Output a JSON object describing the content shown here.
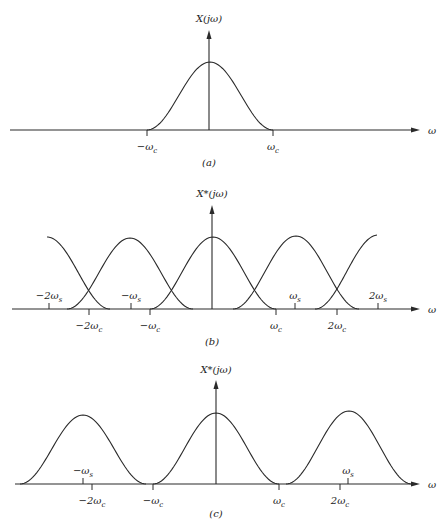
{
  "figure": {
    "panels": [
      {
        "id": "a",
        "caption": "(a)",
        "y_label": "X(jω)",
        "x_label": "ω",
        "axis_y": 130,
        "axis_x_start": 10,
        "axis_x_end": 420,
        "origin_x": 209,
        "arrow_top": 30,
        "caption_pos": [
          209,
          166
        ],
        "ylabel_pos": [
          209,
          22
        ],
        "xlabel_pos": [
          428,
          134
        ],
        "curves": [
          {
            "x0": 147,
            "x1": 273,
            "peak_y": 62
          }
        ],
        "ticks_below": [
          {
            "x": 147,
            "label": "−ω",
            "sub": "c"
          },
          {
            "x": 273,
            "label": "ω",
            "sub": "c"
          }
        ],
        "ticks_above": []
      },
      {
        "id": "b",
        "caption": "(b)",
        "y_label": "X*(jω)",
        "x_label": "ω",
        "axis_y": 309,
        "axis_x_start": 12,
        "axis_x_end": 420,
        "origin_x": 212,
        "arrow_top": 205,
        "caption_pos": [
          212,
          345
        ],
        "ylabel_pos": [
          212,
          197
        ],
        "xlabel_pos": [
          428,
          313
        ],
        "curves": [
          {
            "x0": -16,
            "x1": 110,
            "peak_y": 237,
            "clip": [
              47,
              110
            ]
          },
          {
            "x0": 67,
            "x1": 193,
            "peak_y": 238
          },
          {
            "x0": 150,
            "x1": 276,
            "peak_y": 237
          },
          {
            "x0": 233,
            "x1": 359,
            "peak_y": 236
          },
          {
            "x0": 315,
            "x1": 441,
            "peak_y": 235,
            "clip": [
              315,
              377
            ]
          }
        ],
        "ticks_below": [
          {
            "x": 89,
            "label": "−2ω",
            "sub": "c"
          },
          {
            "x": 150,
            "label": "−ω",
            "sub": "c"
          },
          {
            "x": 276,
            "label": "ω",
            "sub": "c"
          },
          {
            "x": 337,
            "label": "2ω",
            "sub": "c"
          }
        ],
        "ticks_above": [
          {
            "x": 49,
            "label": "−2ω",
            "sub": "s"
          },
          {
            "x": 131,
            "label": "−ω",
            "sub": "s"
          },
          {
            "x": 295,
            "label": "ω",
            "sub": "s"
          },
          {
            "x": 378,
            "label": "2ω",
            "sub": "s"
          }
        ]
      },
      {
        "id": "c",
        "caption": "(c)",
        "y_label": "X*(jω)",
        "x_label": "ω",
        "axis_y": 484,
        "axis_x_start": 15,
        "axis_x_end": 420,
        "origin_x": 216,
        "arrow_top": 380,
        "caption_pos": [
          216,
          517
        ],
        "ylabel_pos": [
          216,
          373
        ],
        "xlabel_pos": [
          428,
          488
        ],
        "curves": [
          {
            "x0": 20,
            "x1": 146,
            "peak_y": 415
          },
          {
            "x0": 153,
            "x1": 279,
            "peak_y": 413
          },
          {
            "x0": 286,
            "x1": 412,
            "peak_y": 411
          }
        ],
        "ticks_below": [
          {
            "x": 92,
            "label": "−2ω",
            "sub": "c"
          },
          {
            "x": 153,
            "label": "−ω",
            "sub": "c"
          },
          {
            "x": 279,
            "label": "ω",
            "sub": "c"
          },
          {
            "x": 340,
            "label": "2ω",
            "sub": "c"
          }
        ],
        "ticks_above": [
          {
            "x": 83,
            "label": "−ω",
            "sub": "s"
          },
          {
            "x": 348,
            "label": "ω",
            "sub": "s"
          }
        ]
      }
    ]
  },
  "colors": {
    "stroke": "#2a2a2a",
    "background": "#ffffff"
  }
}
